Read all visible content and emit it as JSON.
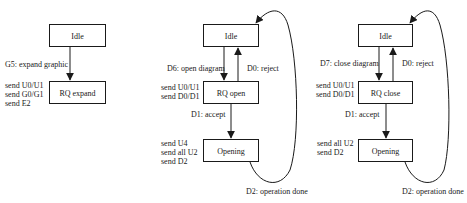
{
  "diagrams": [
    {
      "name": "expand",
      "states": {
        "idle": "Idle",
        "request": "RQ expand"
      },
      "transitions": {
        "trigger": "G5: expand graphic"
      },
      "actions": [
        "send U0/U1",
        "send G0/G1",
        "send E2"
      ]
    },
    {
      "name": "open",
      "states": {
        "idle": "Idle",
        "request": "RQ open",
        "opening": "Opening"
      },
      "transitions": {
        "trigger": "D6: open diagram",
        "reject": "D0: reject",
        "accept": "D1: accept",
        "done": "D2: operation done"
      },
      "request_actions": [
        "send U0/U1",
        "send D0/D1"
      ],
      "opening_actions": [
        "send U4",
        "send all U2",
        "send D2"
      ]
    },
    {
      "name": "close",
      "states": {
        "idle": "Idle",
        "request": "RQ close",
        "opening": "Opening"
      },
      "transitions": {
        "trigger": "D7: close diagram",
        "reject": "D0: reject",
        "accept": "D1: accept",
        "done": "D2: operation done"
      },
      "request_actions": [
        "send U0/U1",
        "send D0/D1"
      ],
      "opening_actions": [
        "send all U2",
        "send D2"
      ]
    }
  ],
  "colors": {
    "stroke": "#1a1a1a",
    "background": "#ffffff"
  }
}
